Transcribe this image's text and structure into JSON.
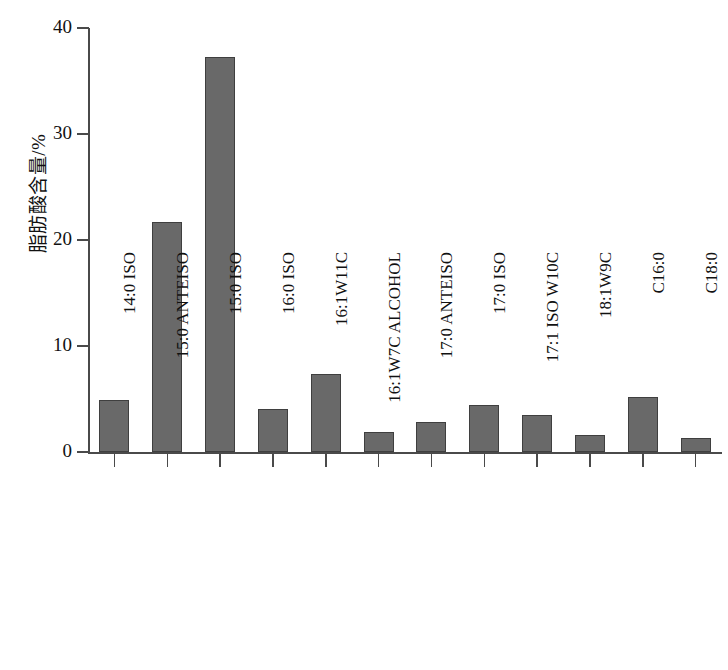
{
  "chart_data": {
    "type": "bar",
    "title": "",
    "xlabel": "",
    "ylabel": "脂肪酸含量/%",
    "ylim": [
      0,
      40
    ],
    "yticks": [
      0,
      10,
      20,
      30,
      40
    ],
    "grid": false,
    "legend": false,
    "bar_color": "#696969",
    "bar_edge_color": "#3f3f3f",
    "axis_color": "#4a4a4a",
    "categories": [
      "14:0 ISO",
      "15:0 ANTEISO",
      "15:0 ISO",
      "16:0 ISO",
      "16:1W11C",
      "16:1W7C ALCOHOL",
      "17:0 ANTEISO",
      "17:0 ISO",
      "17:1 ISO W10C",
      "18:1W9C",
      "C16:0",
      "C18:0"
    ],
    "values": [
      4.9,
      21.7,
      37.3,
      4.1,
      7.4,
      1.9,
      2.8,
      4.4,
      3.5,
      1.6,
      5.2,
      1.3
    ]
  }
}
